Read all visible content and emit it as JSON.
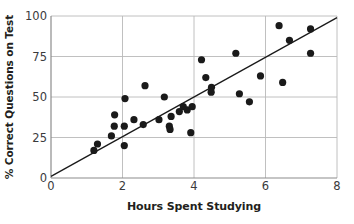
{
  "chart_data": {
    "type": "scatter",
    "title": "",
    "xlabel": "Hours Spent Studying",
    "ylabel": "% Correct Questions on Test",
    "xlim": [
      0,
      8
    ],
    "ylim": [
      0,
      100
    ],
    "xticks": [
      0,
      2,
      4,
      6,
      8
    ],
    "yticks": [
      0,
      25,
      50,
      75,
      100
    ],
    "xtick_labels": [
      "0",
      "2",
      "4",
      "6",
      "8"
    ],
    "ytick_labels": [
      "0",
      "25",
      "50",
      "75",
      "100"
    ],
    "grid": "horizontal-and-vertical-at-ticks",
    "legend": "none",
    "marker_color": "#1a1a1a",
    "marker_size": 5,
    "axis_color": "#8c8c8c",
    "gridline_color": "#b9b9b9",
    "trendline": {
      "label": "line of best fit",
      "color": "#1a1a1a",
      "x0": 0.0,
      "y0": 1.0,
      "x1": 8.0,
      "y1": 99.0
    },
    "points": [
      {
        "x": 1.2,
        "y": 17
      },
      {
        "x": 1.3,
        "y": 21
      },
      {
        "x": 1.69,
        "y": 26
      },
      {
        "x": 1.78,
        "y": 39
      },
      {
        "x": 1.77,
        "y": 32
      },
      {
        "x": 2.05,
        "y": 32
      },
      {
        "x": 2.05,
        "y": 20
      },
      {
        "x": 2.07,
        "y": 49
      },
      {
        "x": 2.32,
        "y": 36
      },
      {
        "x": 2.58,
        "y": 33
      },
      {
        "x": 2.63,
        "y": 57
      },
      {
        "x": 3.02,
        "y": 36
      },
      {
        "x": 3.17,
        "y": 50
      },
      {
        "x": 3.31,
        "y": 32
      },
      {
        "x": 3.33,
        "y": 30
      },
      {
        "x": 3.36,
        "y": 38
      },
      {
        "x": 3.59,
        "y": 41
      },
      {
        "x": 3.7,
        "y": 44
      },
      {
        "x": 3.81,
        "y": 42
      },
      {
        "x": 3.95,
        "y": 44
      },
      {
        "x": 3.91,
        "y": 28
      },
      {
        "x": 4.21,
        "y": 73
      },
      {
        "x": 4.33,
        "y": 62
      },
      {
        "x": 4.49,
        "y": 56
      },
      {
        "x": 4.48,
        "y": 53
      },
      {
        "x": 5.17,
        "y": 77
      },
      {
        "x": 5.27,
        "y": 52
      },
      {
        "x": 5.55,
        "y": 47
      },
      {
        "x": 5.86,
        "y": 63
      },
      {
        "x": 6.38,
        "y": 94
      },
      {
        "x": 6.48,
        "y": 59
      },
      {
        "x": 6.67,
        "y": 85
      },
      {
        "x": 7.26,
        "y": 92
      },
      {
        "x": 7.26,
        "y": 77
      }
    ]
  }
}
